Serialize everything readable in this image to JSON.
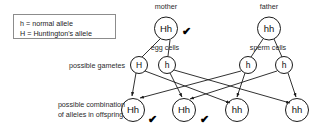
{
  "legend": {
    "name": "allele-key",
    "lines": [
      "h = normal allele",
      "H = Huntington's allele"
    ]
  },
  "row_labels": {
    "gametes": "possible gametes",
    "offspring_line1": "possible combination",
    "offspring_line2": "of alleles in offspring"
  },
  "parents": [
    {
      "role": "mother",
      "title": "mother",
      "genotype": "Hh",
      "cell_label": "egg cells",
      "affected_mark": "✔",
      "has_mark": true
    },
    {
      "role": "father",
      "title": "father",
      "genotype": "hh",
      "cell_label": "sperm cells",
      "affected_mark": "",
      "has_mark": false
    }
  ],
  "gametes": [
    {
      "allele": "H",
      "parent": "mother"
    },
    {
      "allele": "h",
      "parent": "mother"
    },
    {
      "allele": "h",
      "parent": "father"
    },
    {
      "allele": "h",
      "parent": "father"
    }
  ],
  "offspring": [
    {
      "genotype": "Hh",
      "affected_mark": "✔",
      "has_mark": true
    },
    {
      "genotype": "Hh",
      "affected_mark": "✔",
      "has_mark": true
    },
    {
      "genotype": "hh",
      "affected_mark": "",
      "has_mark": false
    },
    {
      "genotype": "hh",
      "affected_mark": "",
      "has_mark": false
    }
  ],
  "colors": {
    "stroke": "#1a1a1a",
    "legend_border": "#8c8c8c",
    "background": "#ffffff",
    "text": "#1a1a1a"
  }
}
